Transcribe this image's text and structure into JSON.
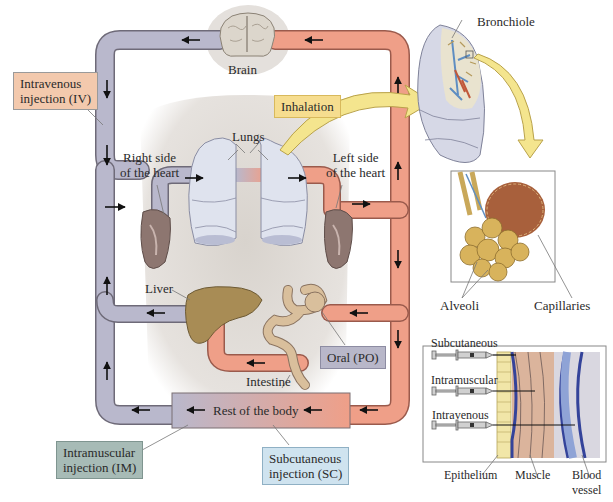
{
  "colors": {
    "venous_pipe": "#b9b8cc",
    "arterial_pipe": "#ef9f88",
    "pipe_outline": "#6e6a78",
    "body_shadow": "#d9d5d0",
    "iv_box": "#f3c9ad",
    "im_box": "#a7bbb6",
    "sc_box": "#cfe3ef",
    "po_box": "#b8b7c9",
    "inhalation_box": "#f6dd8f",
    "inhalation_arrow": "#f4e58e"
  },
  "organs": {
    "brain": "Brain",
    "lungs": "Lungs",
    "right_heart": "Right side\nof the heart",
    "left_heart": "Left side\nof the heart",
    "liver": "Liver",
    "intestine": "Intestine",
    "rest_of_body": "Rest of the body"
  },
  "routes": {
    "iv": "Intravenous\ninjection (IV)",
    "im": "Intramuscular\ninjection (IM)",
    "sc": "Subcutaneous\ninjection (SC)",
    "po": "Oral (PO)",
    "inhalation": "Inhalation"
  },
  "lung_detail": {
    "bronchiole": "Bronchiole",
    "alveoli": "Alveoli",
    "capillaries": "Capillaries"
  },
  "injection_detail": {
    "subcutaneous": "Subcutaneous",
    "intramuscular": "Intramuscular",
    "intravenous": "Intravenous",
    "epithelium": "Epithelium",
    "muscle": "Muscle",
    "blood_vessel": "Blood\nvessel"
  }
}
